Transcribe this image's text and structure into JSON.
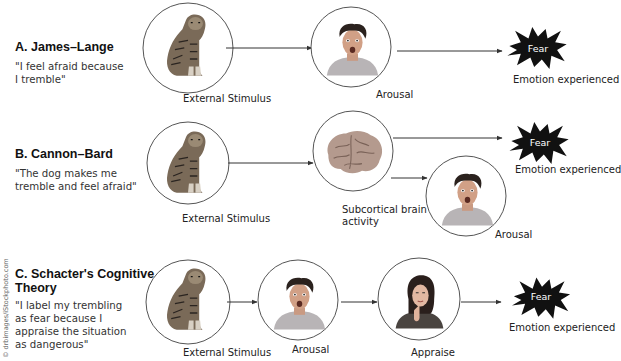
{
  "credit": "© drbimages/iStockphoto.com",
  "colors": {
    "line": "#333333",
    "circle_stroke": "#555555",
    "starburst_fill": "#111111",
    "starburst_text": "#ffffff",
    "text": "#222222"
  },
  "theories": [
    {
      "id": "A",
      "title": "A. James–Lange",
      "quote": "\"I feel afraid because I tremble\"",
      "quote_lines": [
        "\"I feel afraid because",
        "I tremble\""
      ],
      "nodes": [
        {
          "label": "External Stimulus",
          "image": "tiger-icon"
        },
        {
          "label": "Arousal",
          "image": "startled-man-icon"
        },
        {
          "label": "Emotion experienced",
          "badge": "Fear",
          "image": "starburst-icon"
        }
      ]
    },
    {
      "id": "B",
      "title": "B. Cannon–Bard",
      "quote": "\"The dog makes me tremble and feel afraid\"",
      "quote_lines": [
        "\"The dog makes me",
        "tremble and feel afraid\""
      ],
      "nodes": [
        {
          "label": "External Stimulus",
          "image": "tiger-icon"
        },
        {
          "label": "Subcortical brain activity",
          "label_lines": [
            "Subcortical brain",
            "activity"
          ],
          "image": "brain-icon"
        },
        {
          "label": "Emotion experienced",
          "badge": "Fear",
          "image": "starburst-icon"
        },
        {
          "label": "Arousal",
          "image": "startled-man-icon"
        }
      ]
    },
    {
      "id": "C",
      "title": "C. Schacter's Cognitive Theory",
      "title_lines": [
        "C. Schacter's Cognitive",
        "Theory"
      ],
      "quote": "\"I label my trembling as fear because I appraise the situation as dangerous\"",
      "quote_lines": [
        "\"I label my trembling",
        "as fear because I",
        "appraise the situation",
        "as dangerous\""
      ],
      "nodes": [
        {
          "label": "External Stimulus",
          "image": "tiger-icon"
        },
        {
          "label": "Arousal",
          "image": "startled-man-icon"
        },
        {
          "label": "Appraise",
          "image": "thinking-woman-icon"
        },
        {
          "label": "Emotion experienced",
          "badge": "Fear",
          "image": "starburst-icon"
        }
      ]
    }
  ]
}
